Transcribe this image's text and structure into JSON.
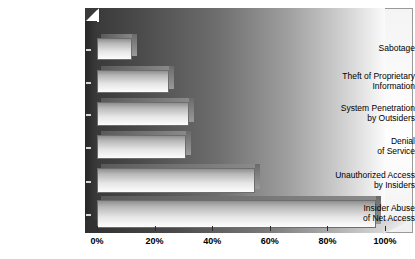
{
  "chart_data": {
    "type": "bar",
    "orientation": "horizontal",
    "title": "",
    "xlabel": "",
    "ylabel": "",
    "xlim": [
      0,
      100
    ],
    "grid": false,
    "legend": null,
    "categories": [
      "Sabotage",
      "Theft of Proprietary Information",
      "System Penetration by Outsiders",
      "Denial of Service",
      "Unauthorized Access by Insiders",
      "Insider Abuse of Net Access"
    ],
    "category_lines": [
      [
        "Sabotage"
      ],
      [
        "Theft of Proprietary",
        "Information"
      ],
      [
        "System Penetration",
        "by Outsiders"
      ],
      [
        "Denial",
        "of Service"
      ],
      [
        "Unauthorized Access",
        "by Insiders"
      ],
      [
        "Insider Abuse",
        "of Net Access"
      ]
    ],
    "values": [
      12,
      25,
      32,
      31,
      55,
      97
    ],
    "xticks": [
      0,
      20,
      40,
      60,
      80,
      100
    ],
    "xtick_labels": [
      "0%",
      "20%",
      "40%",
      "60%",
      "80%",
      "100%"
    ],
    "colors": {
      "bar_top": "#8f8f8f",
      "bar_bottom": "#fdfdfd",
      "bar_border": "#6d6d6d",
      "wall_dark": "#3a3a3a",
      "wall_light": "#fbfbfb",
      "axis": "#2b2b2b",
      "text": "#000000"
    }
  }
}
